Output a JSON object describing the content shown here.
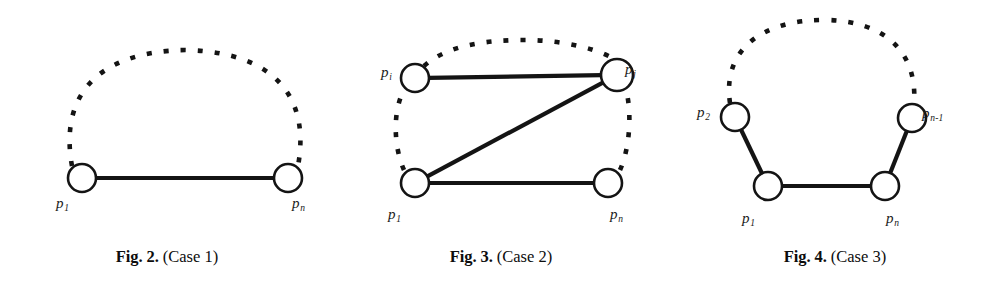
{
  "page": {
    "width": 1002,
    "height": 306,
    "background": "#ffffff",
    "ink_color": "#141414"
  },
  "figures": [
    {
      "id": "fig-2",
      "caption_bold": "Fig. 2.",
      "caption_rest": "(Case 1)",
      "nodes": [
        {
          "name": "p1",
          "label_main": "p",
          "label_sub": "1",
          "cx": 82,
          "cy": 178,
          "r": 14,
          "label_x": 56,
          "label_y": 196
        },
        {
          "name": "pn",
          "label_main": "p",
          "label_sub": "n",
          "cx": 288,
          "cy": 178,
          "r": 14,
          "label_x": 292,
          "label_y": 196
        }
      ],
      "solid_edges": [
        {
          "name": "edge-p1-pn",
          "from": "p1",
          "to": "pn"
        }
      ],
      "dashed_arcs": [
        {
          "name": "arc-p1-pn-top",
          "path": "M 72 166 C 60 100, 92 52, 185 50 C 278 52, 310 100, 298 166"
        }
      ]
    },
    {
      "id": "fig-3",
      "caption_bold": "Fig. 3.",
      "caption_rest": "(Case 2)",
      "nodes": [
        {
          "name": "pi",
          "label_main": "p",
          "label_sub": "i",
          "cx": 81,
          "cy": 78,
          "r": 14,
          "label_x": 47,
          "label_y": 65
        },
        {
          "name": "pj",
          "label_main": "p",
          "label_sub": "j",
          "cx": 283,
          "cy": 75,
          "r": 16,
          "label_x": 291,
          "label_y": 62
        },
        {
          "name": "p1",
          "label_main": "p",
          "label_sub": "1",
          "cx": 81,
          "cy": 183,
          "r": 14,
          "label_x": 54,
          "label_y": 207
        },
        {
          "name": "pn",
          "label_main": "p",
          "label_sub": "n",
          "cx": 274,
          "cy": 183,
          "r": 14,
          "label_x": 276,
          "label_y": 207
        }
      ],
      "solid_edges": [
        {
          "name": "edge-pi-pj",
          "from": "pi",
          "to": "pj"
        },
        {
          "name": "edge-pj-p1",
          "from": "pj",
          "to": "p1"
        },
        {
          "name": "edge-p1-pn",
          "from": "p1",
          "to": "pn"
        }
      ],
      "dashed_arcs": [
        {
          "name": "arc-pi-pj-top",
          "path": "M 90 66 C 112 46, 150 40, 190 40 C 232 40, 268 50, 285 62"
        },
        {
          "name": "arc-p1-pi-left",
          "path": "M 70 170 C 60 148, 58 112, 70 90"
        },
        {
          "name": "arc-pn-pj-right",
          "path": "M 286 170 C 296 148, 298 112, 292 90"
        }
      ]
    },
    {
      "id": "fig-4",
      "caption_bold": "Fig. 4.",
      "caption_rest": "(Case 3)",
      "nodes": [
        {
          "name": "p2",
          "label_main": "p",
          "label_sub": "2",
          "cx": 67,
          "cy": 117,
          "r": 14,
          "label_x": 29,
          "label_y": 105
        },
        {
          "name": "pn1",
          "label_main": "p",
          "label_sub": "n-1",
          "cx": 244,
          "cy": 118,
          "r": 14,
          "label_x": 254,
          "label_y": 106
        },
        {
          "name": "p1",
          "label_main": "p",
          "label_sub": "1",
          "cx": 100,
          "cy": 186,
          "r": 14,
          "label_x": 74,
          "label_y": 211
        },
        {
          "name": "pn",
          "label_main": "p",
          "label_sub": "n",
          "cx": 217,
          "cy": 186,
          "r": 14,
          "label_x": 218,
          "label_y": 211
        }
      ],
      "solid_edges": [
        {
          "name": "edge-p2-p1",
          "from": "p2",
          "to": "p1"
        },
        {
          "name": "edge-p1-pn",
          "from": "p1",
          "to": "pn"
        },
        {
          "name": "edge-pn-pn1",
          "from": "pn",
          "to": "pn1"
        }
      ],
      "dashed_arcs": [
        {
          "name": "arc-p2-pn1-top",
          "path": "M 62 103 C 54 48, 96 20, 156 20 C 214 20, 250 50, 246 104"
        }
      ]
    }
  ],
  "style": {
    "node_fill": "#ffffff",
    "node_stroke": "#141414",
    "node_stroke_width": 2.6,
    "solid_edge_width": 4.2,
    "dashed_stroke_width": 4.6,
    "dash_pattern": "5 12"
  }
}
